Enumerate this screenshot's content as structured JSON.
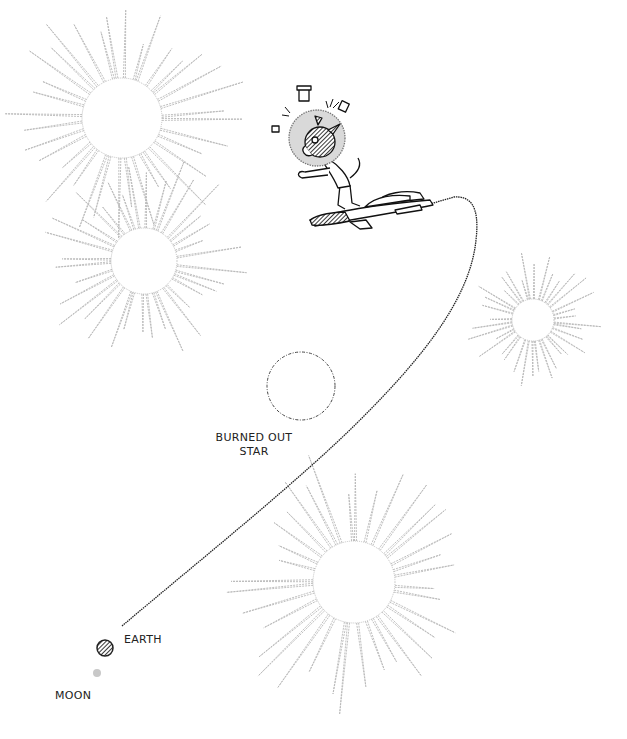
{
  "illustration": {
    "labels": {
      "burned_out_star_line1": "BURNED OUT",
      "burned_out_star_line2": "STAR",
      "earth": "EARTH",
      "moon": "MOON"
    },
    "colors": {
      "background": "#ffffff",
      "star_rays": "#b8b8b8",
      "trajectory": "#222222",
      "earth": "#333333",
      "moon": "#c8c8c8",
      "helmet": "#d9d9d9"
    },
    "stars": [
      {
        "name": "star-top-left",
        "cx": 122,
        "cy": 118,
        "r": 40
      },
      {
        "name": "star-middle-left",
        "cx": 144,
        "cy": 261,
        "r": 33
      },
      {
        "name": "star-right",
        "cx": 533,
        "cy": 320,
        "r": 21
      },
      {
        "name": "star-bottom",
        "cx": 354,
        "cy": 582,
        "r": 41
      },
      {
        "name": "burned-out-star",
        "cx": 301,
        "cy": 386,
        "r": 34
      }
    ]
  }
}
